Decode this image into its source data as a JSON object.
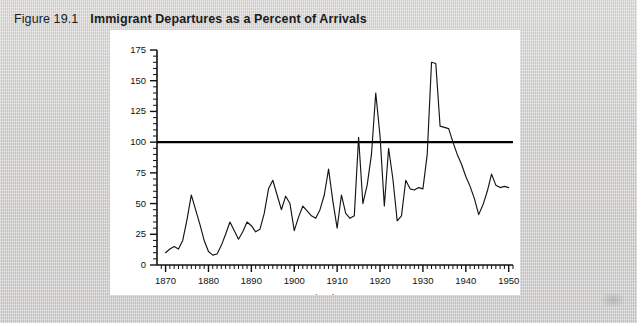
{
  "figure": {
    "number": "Figure 19.1",
    "title": "Immigrant Departures as a Percent of Arrivals"
  },
  "colors": {
    "page_background": "#d5d4d2",
    "panel_background": "#ffffff",
    "ink": "#141414",
    "reference_line": "#000000"
  },
  "chart_data": {
    "type": "line",
    "title": "Immigrant Departures as a Percent of Arrivals",
    "xlabel": "Fiscal Years",
    "ylabel": "",
    "xlim": [
      1868,
      1951
    ],
    "ylim": [
      0,
      175
    ],
    "ytick_labels": [
      "0",
      "25",
      "50",
      "75",
      "100",
      "125",
      "150",
      "175"
    ],
    "yticks": [
      0,
      25,
      50,
      75,
      100,
      125,
      150,
      175
    ],
    "y_minor_tick_step": 5,
    "xtick_labels": [
      "1870",
      "1880",
      "1890",
      "1900",
      "1910",
      "1920",
      "1930",
      "1940",
      "1950"
    ],
    "xticks": [
      1870,
      1880,
      1890,
      1900,
      1910,
      1920,
      1930,
      1940,
      1950
    ],
    "x_minor_tick_step": 1,
    "grid": false,
    "legend": null,
    "annotations": [
      {
        "name": "reference-line-100",
        "type": "hline",
        "value": 100,
        "label": "100 percent"
      }
    ],
    "series": [
      {
        "name": "Departures as percent of arrivals",
        "x": [
          1870,
          1871,
          1872,
          1873,
          1874,
          1875,
          1876,
          1877,
          1878,
          1879,
          1880,
          1881,
          1882,
          1883,
          1884,
          1885,
          1886,
          1887,
          1888,
          1889,
          1890,
          1891,
          1892,
          1893,
          1894,
          1895,
          1896,
          1897,
          1898,
          1899,
          1900,
          1901,
          1902,
          1903,
          1904,
          1905,
          1906,
          1907,
          1908,
          1909,
          1910,
          1911,
          1912,
          1913,
          1914,
          1915,
          1916,
          1917,
          1918,
          1919,
          1920,
          1921,
          1922,
          1923,
          1924,
          1925,
          1926,
          1927,
          1928,
          1929,
          1930,
          1931,
          1932,
          1933,
          1934,
          1935,
          1936,
          1937,
          1938,
          1939,
          1940,
          1941,
          1942,
          1943,
          1944,
          1945,
          1946,
          1947,
          1948,
          1949,
          1950
        ],
        "y": [
          10,
          13,
          15,
          13,
          20,
          37,
          57,
          45,
          33,
          20,
          11,
          8,
          9,
          16,
          25,
          35,
          28,
          21,
          27,
          35,
          32,
          27,
          29,
          42,
          62,
          69,
          57,
          45,
          56,
          50,
          28,
          39,
          48,
          44,
          40,
          38,
          45,
          57,
          78,
          52,
          30,
          57,
          42,
          38,
          40,
          104,
          50,
          65,
          90,
          140,
          105,
          48,
          95,
          70,
          36,
          40,
          69,
          62,
          61,
          63,
          62,
          90,
          165,
          164,
          113,
          112,
          111,
          100,
          90,
          82,
          72,
          64,
          54,
          41,
          49,
          60,
          74,
          65,
          63,
          64,
          63
        ]
      }
    ]
  },
  "axis_titles": {
    "x": "Fiscal Years"
  }
}
